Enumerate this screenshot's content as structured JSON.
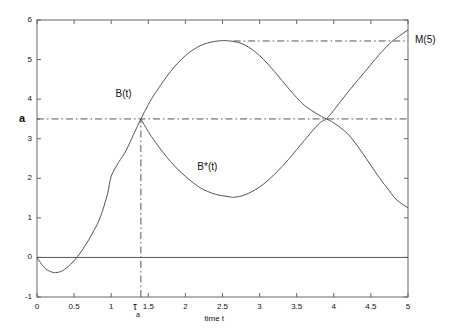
{
  "chart_data": {
    "type": "line",
    "title": "",
    "xlabel": "time t",
    "ylabel": "a",
    "xlim": [
      0,
      5
    ],
    "ylim": [
      -1,
      6
    ],
    "grid": false,
    "legend_position": "inline-annotations",
    "xticks": [
      0,
      0.5,
      1,
      1.5,
      2,
      2.5,
      3,
      3.5,
      4,
      4.5,
      5
    ],
    "xtick_labels": [
      "0",
      "0.5",
      "1",
      "1.5",
      "2",
      "2.5",
      "3",
      "3.5",
      "4",
      "4.5",
      "5"
    ],
    "yticks": [
      -1,
      0,
      1,
      2,
      3,
      4,
      5,
      6
    ],
    "ytick_labels": [
      "-1",
      "0",
      "1",
      "2",
      "3",
      "4",
      "5",
      "6"
    ],
    "y_special_tick": {
      "value": 3.5,
      "label": "a"
    },
    "series": [
      {
        "name": "B(t)",
        "style": "solid",
        "color": "#555555",
        "x": [
          0,
          0.1,
          0.2,
          0.27,
          0.35,
          0.45,
          0.55,
          0.65,
          0.75,
          0.85,
          0.95,
          1.0,
          1.1,
          1.2,
          1.3,
          1.4,
          1.5,
          1.6,
          1.8,
          2.0,
          2.2,
          2.4,
          2.6,
          2.8,
          3.0,
          3.2,
          3.4,
          3.6,
          3.8,
          3.9,
          4.0,
          4.2,
          4.4,
          4.6,
          4.75,
          4.85,
          5.0
        ],
        "y": [
          0.0,
          -0.26,
          -0.37,
          -0.38,
          -0.33,
          -0.18,
          0.03,
          0.3,
          0.62,
          1.0,
          1.6,
          2.05,
          2.4,
          2.7,
          3.1,
          3.5,
          3.86,
          4.17,
          4.7,
          5.1,
          5.35,
          5.46,
          5.47,
          5.37,
          5.1,
          4.7,
          4.25,
          3.85,
          3.6,
          3.5,
          3.4,
          3.1,
          2.6,
          2.05,
          1.68,
          1.45,
          1.25
        ]
      },
      {
        "name": "B*(t)",
        "style": "solid",
        "color": "#555555",
        "x": [
          1.4,
          1.5,
          1.6,
          1.8,
          2.0,
          2.2,
          2.4,
          2.6,
          2.65,
          2.8,
          3.0,
          3.2,
          3.4,
          3.6,
          3.8,
          3.9,
          4.0,
          4.2,
          4.4,
          4.6,
          4.75,
          4.85,
          5.0
        ],
        "y": [
          3.5,
          3.18,
          2.9,
          2.42,
          2.05,
          1.76,
          1.6,
          1.53,
          1.52,
          1.58,
          1.78,
          2.1,
          2.5,
          2.95,
          3.38,
          3.5,
          3.72,
          4.2,
          4.65,
          5.1,
          5.4,
          5.55,
          5.75
        ]
      }
    ],
    "reference_lines": [
      {
        "name": "a-level",
        "orientation": "horizontal",
        "value": 3.5,
        "style": "dash-dot",
        "x_from": 0,
        "x_to": 5
      },
      {
        "name": "zero-line",
        "orientation": "horizontal",
        "value": 0,
        "style": "solid",
        "x_from": 0,
        "x_to": 5
      },
      {
        "name": "M5-level",
        "orientation": "horizontal",
        "value": 5.47,
        "style": "dash-dot",
        "x_from": 2.65,
        "x_to": 5
      },
      {
        "name": "tau-a-line",
        "orientation": "vertical",
        "value": 1.4,
        "style": "dash-dot",
        "y_from": -1,
        "y_to": 3.5
      }
    ],
    "annotations": [
      {
        "name": "b-curve-label",
        "text": "B(t)",
        "x": 1.22,
        "y": 4.1
      },
      {
        "name": "bstar-curve-label",
        "text": "B*(t)",
        "x": 2.35,
        "y": 2.25
      },
      {
        "name": "m5-label",
        "text": "M(5)",
        "x": 5.12,
        "y": 5.47
      },
      {
        "name": "tau-a-label",
        "text": "τ",
        "subscript": "a",
        "x": 1.4,
        "y": -1.25
      }
    ]
  },
  "axis": {
    "x_title": "time t",
    "y_special_label": "a",
    "x_tick_labels": [
      "0",
      "0.5",
      "1",
      "1.5",
      "2",
      "2.5",
      "3",
      "3.5",
      "4",
      "4.5",
      "5"
    ],
    "y_tick_labels": [
      "6",
      "5",
      "4",
      "3",
      "2",
      "1",
      "0",
      "-1"
    ]
  },
  "labels": {
    "b_curve": "B(t)",
    "bstar_curve": "B*(t)",
    "m5": "M(5)",
    "tau": "τ",
    "tau_subscript": "a"
  }
}
